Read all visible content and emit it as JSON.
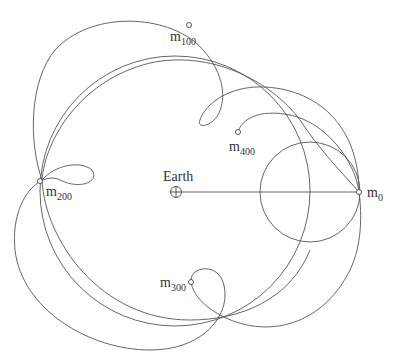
{
  "diagram": {
    "center_label": "Earth",
    "markers": [
      {
        "id": "m0",
        "base": "m",
        "sub": "0"
      },
      {
        "id": "m100",
        "base": "m",
        "sub": "100"
      },
      {
        "id": "m200",
        "base": "m",
        "sub": "200"
      },
      {
        "id": "m300",
        "base": "m",
        "sub": "300"
      },
      {
        "id": "m400",
        "base": "m",
        "sub": "400"
      }
    ],
    "colors": {
      "stroke": "#555555",
      "background": "#ffffff",
      "text": "#333333"
    }
  }
}
